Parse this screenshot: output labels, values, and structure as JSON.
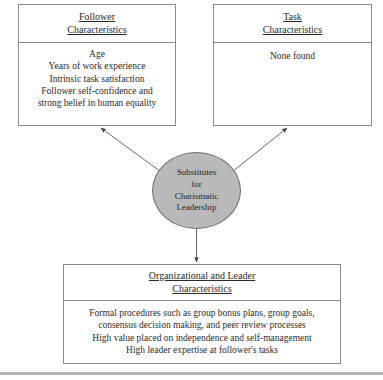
{
  "diagram": {
    "type": "flow-diagram",
    "center_node": {
      "shape": "ellipse",
      "fill_color": "#b9b9b9",
      "border_color": "#6f6f6f",
      "lines": [
        "Substitutes",
        "for",
        "Charismatic",
        "Leadership"
      ]
    },
    "boxes": [
      {
        "id": "follower",
        "header_lines": [
          "Follower",
          "Characteristics"
        ],
        "body_lines": [
          "Age",
          "Years of work experience",
          "Intrinsic task satisfaction",
          "Follower self-confidence and",
          "strong belief in human equality"
        ]
      },
      {
        "id": "task",
        "header_lines": [
          "Task",
          "Characteristics"
        ],
        "body_lines": [
          "None found"
        ]
      },
      {
        "id": "organizational",
        "header_lines": [
          "Organizational and Leader",
          "Characteristics"
        ],
        "body_lines": [
          "Formal procedures such as group bonus plans, group goals,",
          "consensus decision making, and peer review processes",
          "High value placed on independence and self-management",
          "High leader expertise at follower's tasks"
        ]
      }
    ],
    "arrows": [
      {
        "id": "to-follower",
        "from": "center-node",
        "to": "follower-box",
        "direction": "up-left"
      },
      {
        "id": "to-task",
        "from": "center-node",
        "to": "task-box",
        "direction": "up-right"
      },
      {
        "id": "to-organizational",
        "from": "center-node",
        "to": "organizational-box",
        "direction": "down"
      }
    ],
    "rule_color": "#b3b3b3",
    "border_color": "#8a8a8a"
  }
}
